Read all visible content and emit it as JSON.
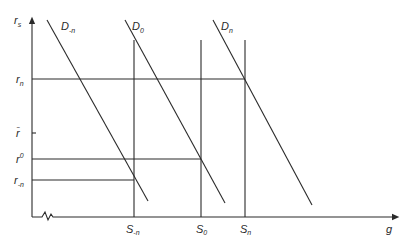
{
  "diagram": {
    "axes": {
      "y_label": "r",
      "y_label_sub": "s",
      "x_label": "g"
    },
    "demand_curves": [
      {
        "id": "D-n",
        "label": "D",
        "sub": "-n"
      },
      {
        "id": "D0",
        "label": "D",
        "sub": "0"
      },
      {
        "id": "Dn",
        "label": "D",
        "sub": "n"
      }
    ],
    "supply_lines": [
      {
        "id": "S-n",
        "label": "S",
        "sub": "-n"
      },
      {
        "id": "S0",
        "label": "S",
        "sub": "0"
      },
      {
        "id": "Sn",
        "label": "S",
        "sub": "n"
      }
    ],
    "rate_levels": [
      {
        "id": "r_n",
        "label": "r",
        "sub": "n"
      },
      {
        "id": "r_bar",
        "label": "r̄",
        "sub": ""
      },
      {
        "id": "r0",
        "label": "r",
        "sup": "0"
      },
      {
        "id": "r_-n",
        "label": "r",
        "sub": "-n"
      }
    ]
  }
}
